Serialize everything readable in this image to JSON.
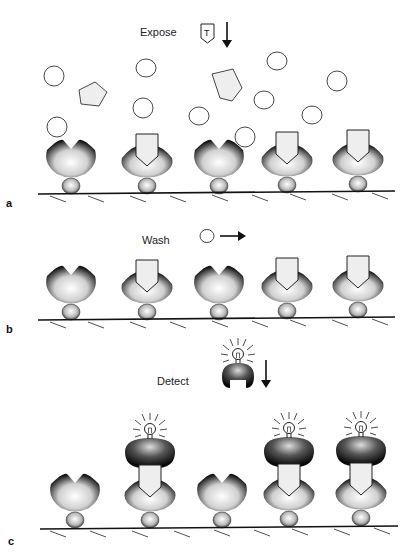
{
  "panels": [
    {
      "id": "a",
      "panel_label": "a",
      "step_label": "Expose",
      "step_icon": "target-molecule-icon",
      "step_icon_text": "T",
      "step_arrow": "down-arrow",
      "description": "Surface-bound receptors exposed to mixture of target (pentagons) and non-target (circles) molecules"
    },
    {
      "id": "b",
      "panel_label": "b",
      "step_label": "Wash",
      "step_icon": "unbound-molecule-icon",
      "step_arrow": "right-arrow",
      "description": "Unbound molecules washed away; targets remain bound to receptors 2, 4 and 5"
    },
    {
      "id": "c",
      "panel_label": "c",
      "step_label": "Detect",
      "step_icon": "detection-reagent-icon",
      "step_arrow": "down-arrow",
      "description": "Labelled detection reagent binds to captured targets and emits signal"
    }
  ],
  "receptors_per_panel": 5,
  "bound_receptors": [
    2,
    4,
    5
  ],
  "colors": {
    "line": "#111111",
    "target_fill": "#eeeeee",
    "background": "#ffffff"
  }
}
